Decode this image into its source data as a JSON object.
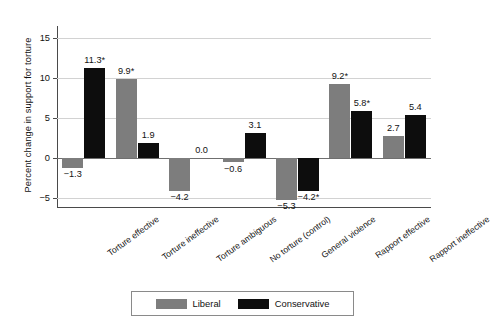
{
  "chart_data": {
    "type": "bar",
    "title": "",
    "subtitle": "",
    "xlabel": "",
    "ylabel": "Percent change in support for torture",
    "ylim": [
      -6.3,
      16.5
    ],
    "yticks": [
      15,
      10,
      5,
      0,
      -5
    ],
    "ytick_labels": [
      "15",
      "10",
      "5",
      "0",
      "−5"
    ],
    "grid": true,
    "legend_position": "bottom-center",
    "categories": [
      "Torture effective",
      "Torture ineffective",
      "Torture ambiguous",
      "No torture (control)",
      "General violence",
      "Rapport effective",
      "Rapport ineffective"
    ],
    "series": [
      {
        "name": "Liberal",
        "color": "#7d7d7d",
        "values": [
          -1.3,
          9.9,
          -4.2,
          -0.6,
          -5.3,
          9.2,
          2.7
        ],
        "labels": [
          "−1.3",
          "9.9*",
          "−4.2",
          "−0.6",
          "−5.3",
          "9.2*",
          "2.7"
        ]
      },
      {
        "name": "Conservative",
        "color": "#0d0d0d",
        "values": [
          11.3,
          1.9,
          0.0,
          3.1,
          -4.2,
          5.8,
          5.4
        ],
        "labels": [
          "11.3*",
          "1.9",
          "0.0",
          "3.1",
          "−4.2*",
          "5.8*",
          "5.4"
        ]
      }
    ],
    "annotation_note": "Asterisk (*) denotes statistical significance"
  },
  "legend": {
    "items": [
      {
        "label": "Liberal",
        "color": "#7d7d7d"
      },
      {
        "label": "Conservative",
        "color": "#0d0d0d"
      }
    ]
  }
}
